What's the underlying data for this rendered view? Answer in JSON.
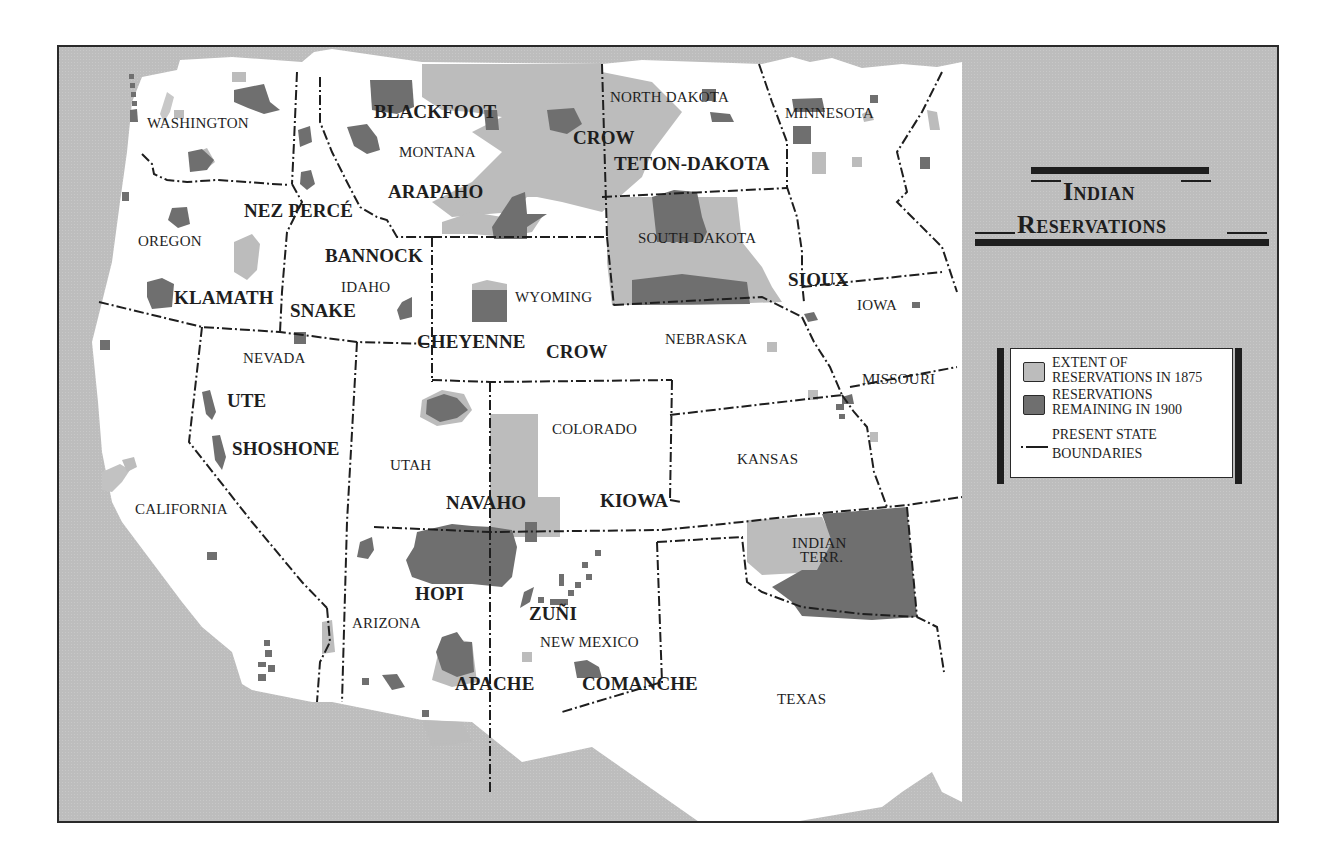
{
  "title": {
    "line1": "Indian",
    "line2": "Reservations"
  },
  "colors": {
    "sea": "#bdbdbd",
    "land": "#ffffff",
    "extent_1875": "#bcbcbc",
    "remaining_1900": "#6f6f6f",
    "ink": "#1e1e1e"
  },
  "legend": {
    "items": [
      {
        "swatch": "extent_1875",
        "line1": "EXTENT OF",
        "line2": "RESERVATIONS IN 1875"
      },
      {
        "swatch": "remaining_1900",
        "line1": "RESERVATIONS",
        "line2": "REMAINING IN 1900"
      },
      {
        "swatch": "dash-dot-line",
        "line1": "PRESENT STATE",
        "line2": "BOUNDARIES"
      }
    ]
  },
  "states": [
    {
      "name": "WASHINGTON",
      "x": 145,
      "y": 122
    },
    {
      "name": "OREGON",
      "x": 136,
      "y": 240
    },
    {
      "name": "CALIFORNIA",
      "x": 133,
      "y": 508
    },
    {
      "name": "NEVADA",
      "x": 241,
      "y": 357
    },
    {
      "name": "IDAHO",
      "x": 339,
      "y": 286
    },
    {
      "name": "MONTANA",
      "x": 397,
      "y": 151
    },
    {
      "name": "WYOMING",
      "x": 513,
      "y": 296
    },
    {
      "name": "UTAH",
      "x": 388,
      "y": 464
    },
    {
      "name": "ARIZONA",
      "x": 350,
      "y": 622
    },
    {
      "name": "COLORADO",
      "x": 550,
      "y": 428
    },
    {
      "name": "NEW MEXICO",
      "x": 538,
      "y": 641
    },
    {
      "name": "NORTH DAKOTA",
      "x": 608,
      "y": 96
    },
    {
      "name": "SOUTH DAKOTA",
      "x": 636,
      "y": 237
    },
    {
      "name": "NEBRASKA",
      "x": 663,
      "y": 338
    },
    {
      "name": "KANSAS",
      "x": 735,
      "y": 458
    },
    {
      "name": "MINNESOTA",
      "x": 783,
      "y": 112
    },
    {
      "name": "IOWA",
      "x": 855,
      "y": 304
    },
    {
      "name": "MISSOURI",
      "x": 860,
      "y": 378
    },
    {
      "name": "TEXAS",
      "x": 775,
      "y": 698
    },
    {
      "name": "INDIAN",
      "x": 790,
      "y": 542
    },
    {
      "name": "TERR.",
      "x": 798,
      "y": 556
    }
  ],
  "tribes": [
    {
      "name": "BLACKFOOT",
      "x": 372,
      "y": 108
    },
    {
      "name": "CROW",
      "x": 571,
      "y": 134
    },
    {
      "name": "TETON-DAKOTA",
      "x": 612,
      "y": 160
    },
    {
      "name": "ARAPAHO",
      "x": 386,
      "y": 188
    },
    {
      "name": "NEZ PERCÉ",
      "x": 242,
      "y": 207
    },
    {
      "name": "BANNOCK",
      "x": 323,
      "y": 252
    },
    {
      "name": "KLAMATH",
      "x": 172,
      "y": 294
    },
    {
      "name": "SNAKE",
      "x": 288,
      "y": 307
    },
    {
      "name": "CHEYENNE",
      "x": 415,
      "y": 338
    },
    {
      "name": "CROW",
      "x": 544,
      "y": 348
    },
    {
      "name": "SIOUX",
      "x": 786,
      "y": 276
    },
    {
      "name": "UTE",
      "x": 225,
      "y": 397
    },
    {
      "name": "SHOSHONE",
      "x": 230,
      "y": 445
    },
    {
      "name": "NAVAHO",
      "x": 444,
      "y": 499
    },
    {
      "name": "KIOWA",
      "x": 598,
      "y": 497
    },
    {
      "name": "HOPI",
      "x": 413,
      "y": 590
    },
    {
      "name": "ZUÑI",
      "x": 527,
      "y": 610
    },
    {
      "name": "APACHE",
      "x": 453,
      "y": 680
    },
    {
      "name": "COMANCHE",
      "x": 580,
      "y": 680
    }
  ]
}
